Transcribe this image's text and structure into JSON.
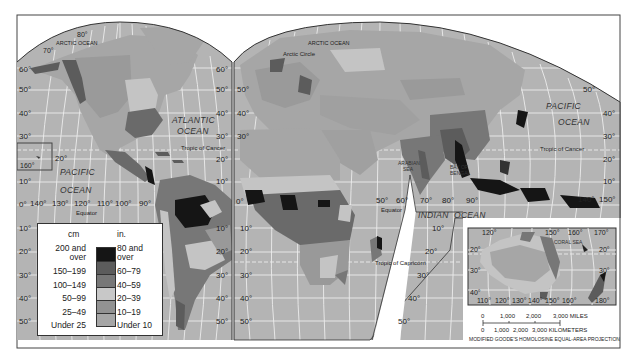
{
  "map": {
    "title": "World Average Annual Precipitation",
    "projection_label": "MODIFIED GOODE'S HOMOLOSINE EQUAL-AREA PROJECTION",
    "colors": {
      "ocean": "#b4b4b4",
      "grid": "#ececec",
      "frame": "#333333",
      "c200_over": "#151515",
      "c150_199": "#5c5c5c",
      "c100_149": "#777777",
      "c50_99": "#c4c4c4",
      "c25_49": "#9a9a9a",
      "c_under25": "#a8a8a8"
    },
    "oceans": [
      {
        "id": "arctic-ocean-west",
        "text": "ARCTIC OCEAN"
      },
      {
        "id": "arctic-ocean-east",
        "text": "ARCTIC OCEAN"
      },
      {
        "id": "atlantic-1",
        "text": "ATLANTIC"
      },
      {
        "id": "atlantic-2",
        "text": "OCEAN"
      },
      {
        "id": "pacific-west-1",
        "text": "PACIFIC"
      },
      {
        "id": "pacific-west-2",
        "text": "OCEAN"
      },
      {
        "id": "pacific-east-1",
        "text": "PACIFIC"
      },
      {
        "id": "pacific-east-2",
        "text": "OCEAN"
      },
      {
        "id": "indian-1",
        "text": "INDIAN"
      },
      {
        "id": "indian-2",
        "text": "OCEAN"
      }
    ],
    "seas": {
      "arabian_1": "ARABIAN",
      "arabian_2": "SEA",
      "bengal_1": "BAY OF",
      "bengal_2": "BENGAL",
      "coral": "CORAL   SEA"
    },
    "lines": {
      "arctic_circle": "Arctic Circle",
      "tropic_cancer": "Tropic of Cancer",
      "tropic_cancer_east": "Tropic of Cancer",
      "equator_west": "Equator",
      "equator_east": "Equator",
      "tropic_capricorn": "Tropic of Capricorn"
    },
    "lat_labels_left": [
      "60°",
      "50°",
      "40°",
      "30°",
      "20°",
      "10°",
      "0°",
      "10°",
      "20°",
      "30°",
      "40°",
      "50°"
    ],
    "lat_labels_mid_left": [
      "60°",
      "50°",
      "40°",
      "30°",
      "20°",
      "10°"
    ],
    "lat_labels_mid_right": [
      "60°",
      "50°",
      "40°",
      "30°"
    ],
    "lat_labels_south_mid_left": [
      "10°",
      "20°",
      "30°",
      "40°",
      "50°"
    ],
    "lat_labels_south_mid_right": [
      "10°",
      "20°",
      "30°",
      "40°",
      "50°"
    ],
    "lat_labels_east": [
      "50°",
      "40°",
      "30°",
      "20°",
      "10°"
    ],
    "lat_labels_africa_east": [
      "10°",
      "20°",
      "30°",
      "40°",
      "50°"
    ],
    "top_labels": {
      "lat80": "80°",
      "lat70": "70°"
    },
    "hawaii_inset_label": "160°",
    "hawaii_lat": "20°",
    "lon_labels_pacific": [
      "140°",
      "130°",
      "120°",
      "110°",
      "100°",
      "90°"
    ],
    "lon_labels_indian": [
      "50°",
      "60°",
      "70°",
      "80°",
      "90°"
    ],
    "lon_labels_png": [
      "140°",
      "150°"
    ],
    "zero_lon": "0°",
    "australia_inset": {
      "top_lon": [
        "120°",
        "150°",
        "160°",
        "170°"
      ],
      "bottom_lon": [
        "110°",
        "120°",
        "130°",
        "140°",
        "150°",
        "160°",
        "180°"
      ],
      "left_lat": [
        "20°",
        "30°",
        "40°"
      ],
      "right_lat": [
        "20°",
        "30°"
      ]
    }
  },
  "legend": {
    "cm_header": "cm",
    "in_header": "in.",
    "rows": [
      {
        "cm": "200 and",
        "cm2": "over",
        "in": "80 and",
        "in2": "over",
        "color": "#151515"
      },
      {
        "cm": "150–199",
        "in": "60–79",
        "color": "#5c5c5c"
      },
      {
        "cm": "100–149",
        "in": "40–59",
        "color": "#777777"
      },
      {
        "cm": "50–99",
        "in": "20–39",
        "color": "#c8c8c8"
      },
      {
        "cm": "25–49",
        "in": "10–19",
        "color": "#929292"
      },
      {
        "cm": "Under 25",
        "in": "Under 10",
        "color": "#a6a6a6"
      }
    ]
  },
  "scale": {
    "miles_ticks": [
      "0",
      "1,000",
      "2,000",
      "3,000 MILES"
    ],
    "km_ticks": [
      "0",
      "1,000",
      "2,000",
      "3,000 KILOMETERS"
    ]
  }
}
